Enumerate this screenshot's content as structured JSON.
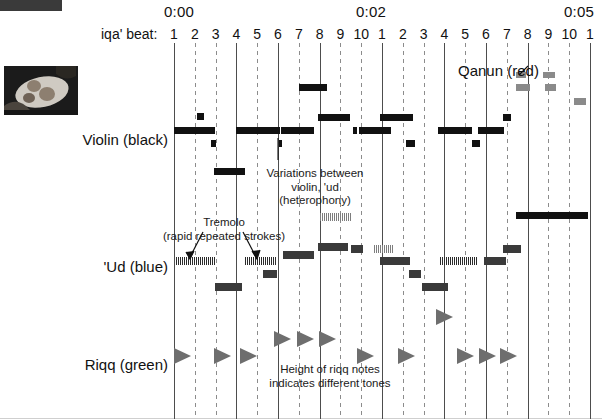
{
  "figure": {
    "title_slug": "",
    "thumbnail_alt": "riqq-photo"
  },
  "time_axis": {
    "ticks": [
      {
        "label": "0:00",
        "x": 182
      },
      {
        "label": "0:02",
        "x": 374
      },
      {
        "label": "0:05",
        "x": 582
      }
    ]
  },
  "beat_axis": {
    "title": "iqa' beat:",
    "labels": [
      "1",
      "2",
      "3",
      "4",
      "5",
      "6",
      "7",
      "8",
      "9",
      "10",
      "1",
      "2",
      "3",
      "4",
      "5",
      "6",
      "7",
      "8",
      "9",
      "10",
      "1"
    ]
  },
  "rows": [
    {
      "name": "violin",
      "label": "Violin (black)",
      "label_x": 78,
      "label_y": 131
    },
    {
      "name": "ud",
      "label": "'Ud (blue)",
      "label_x": 78,
      "label_y": 258
    },
    {
      "name": "riqq",
      "label": "Riqq (green)",
      "label_x": 78,
      "label_y": 356
    },
    {
      "name": "qanun",
      "label": "Qanun (red)",
      "label_x": 458,
      "label_y": 62
    }
  ],
  "annotations": [
    {
      "id": "heterophony",
      "text": "Variations between\nviolin, 'ud\n(heterophony)",
      "x": 315,
      "y": 167
    },
    {
      "id": "tremolo",
      "text": "Tremolo\n(rapid repeated strokes)",
      "x": 224,
      "y": 216
    },
    {
      "id": "riqq-height",
      "text": "Height of riqq notes\nindicates different tones",
      "x": 330,
      "y": 363
    }
  ],
  "chart_data": {
    "type": "timeline",
    "xlabel": "iqa' beat",
    "ylabel": "instrument",
    "grid": true,
    "x_start": 174,
    "x_end": 590,
    "beat_count": 21,
    "solid_beats": [
      1,
      4,
      6,
      8,
      11,
      14,
      16,
      18,
      21
    ],
    "legend": [
      {
        "name": "Violin",
        "color": "black"
      },
      {
        "name": "'Ud",
        "color": "blue"
      },
      {
        "name": "Riqq",
        "color": "green"
      },
      {
        "name": "Qanun",
        "color": "red"
      }
    ],
    "series": [
      {
        "name": "Violin (black)",
        "color": "#111111",
        "notes": [
          {
            "x": 174,
            "w": 41,
            "y": 127,
            "h": 7,
            "style": "solid"
          },
          {
            "x": 197,
            "w": 7,
            "y": 113,
            "h": 7,
            "style": "solid"
          },
          {
            "x": 198,
            "w": 7,
            "y": 127,
            "h": 7,
            "style": "solid"
          },
          {
            "x": 211,
            "w": 5,
            "y": 140,
            "h": 7,
            "style": "solid"
          },
          {
            "x": 214,
            "w": 31,
            "y": 168,
            "h": 7,
            "style": "solid"
          },
          {
            "x": 236,
            "w": 44,
            "y": 127,
            "h": 7,
            "style": "solid"
          },
          {
            "x": 279,
            "w": 3,
            "y": 140,
            "h": 7,
            "style": "solid"
          },
          {
            "x": 281,
            "w": 33,
            "y": 127,
            "h": 7,
            "style": "solid"
          },
          {
            "x": 318,
            "w": 32,
            "y": 114,
            "h": 7,
            "style": "solid"
          },
          {
            "x": 299,
            "w": 28,
            "y": 84,
            "h": 7,
            "style": "solid"
          },
          {
            "x": 353,
            "w": 4,
            "y": 127,
            "h": 7,
            "style": "solid"
          },
          {
            "x": 359,
            "w": 32,
            "y": 127,
            "h": 7,
            "style": "solid"
          },
          {
            "x": 380,
            "w": 33,
            "y": 114,
            "h": 7,
            "style": "solid"
          },
          {
            "x": 406,
            "w": 9,
            "y": 140,
            "h": 7,
            "style": "solid"
          },
          {
            "x": 438,
            "w": 30,
            "y": 127,
            "h": 7,
            "style": "solid"
          },
          {
            "x": 466,
            "w": 6,
            "y": 127,
            "h": 7,
            "style": "solid"
          },
          {
            "x": 472,
            "w": 8,
            "y": 140,
            "h": 7,
            "style": "solid"
          },
          {
            "x": 478,
            "w": 26,
            "y": 127,
            "h": 7,
            "style": "solid"
          },
          {
            "x": 503,
            "w": 8,
            "y": 114,
            "h": 7,
            "style": "solid"
          },
          {
            "x": 516,
            "w": 72,
            "y": 212,
            "h": 7,
            "style": "solid"
          }
        ]
      },
      {
        "name": "'Ud (blue)",
        "color": "#3a3a3a",
        "notes": [
          {
            "x": 176,
            "w": 40,
            "y": 257,
            "h": 8,
            "style": "tremolo"
          },
          {
            "x": 215,
            "w": 27,
            "y": 283,
            "h": 8,
            "style": "solid"
          },
          {
            "x": 245,
            "w": 31,
            "y": 257,
            "h": 8,
            "style": "tremolo"
          },
          {
            "x": 263,
            "w": 14,
            "y": 270,
            "h": 8,
            "style": "solid"
          },
          {
            "x": 283,
            "w": 31,
            "y": 251,
            "h": 8,
            "style": "solid"
          },
          {
            "x": 318,
            "w": 30,
            "y": 243,
            "h": 8,
            "style": "solid"
          },
          {
            "x": 320,
            "w": 32,
            "y": 213,
            "h": 8,
            "style": "tremolo-light"
          },
          {
            "x": 351,
            "w": 12,
            "y": 245,
            "h": 8,
            "style": "solid"
          },
          {
            "x": 374,
            "w": 20,
            "y": 245,
            "h": 8,
            "style": "tremolo-light"
          },
          {
            "x": 380,
            "w": 30,
            "y": 257,
            "h": 8,
            "style": "solid"
          },
          {
            "x": 409,
            "w": 12,
            "y": 270,
            "h": 8,
            "style": "solid"
          },
          {
            "x": 422,
            "w": 26,
            "y": 283,
            "h": 8,
            "style": "solid"
          },
          {
            "x": 440,
            "w": 38,
            "y": 257,
            "h": 8,
            "style": "tremolo"
          },
          {
            "x": 484,
            "w": 22,
            "y": 257,
            "h": 8,
            "style": "solid"
          },
          {
            "x": 503,
            "w": 18,
            "y": 245,
            "h": 8,
            "style": "solid"
          }
        ]
      },
      {
        "name": "Qanun (red)",
        "color": "#8a8a8a",
        "notes": [
          {
            "x": 516,
            "w": 10,
            "y": 72,
            "h": 6,
            "style": "solid"
          },
          {
            "x": 543,
            "w": 12,
            "y": 72,
            "h": 6,
            "style": "solid"
          },
          {
            "x": 516,
            "w": 14,
            "y": 84,
            "h": 7,
            "style": "solid"
          },
          {
            "x": 545,
            "w": 11,
            "y": 84,
            "h": 7,
            "style": "solid"
          },
          {
            "x": 574,
            "w": 12,
            "y": 98,
            "h": 7,
            "style": "solid"
          }
        ]
      },
      {
        "name": "Riqq (green)",
        "color": "#6e6e6e",
        "notes": [
          {
            "x": 174,
            "y": 348
          },
          {
            "x": 214,
            "y": 348
          },
          {
            "x": 240,
            "y": 348
          },
          {
            "x": 274,
            "y": 331
          },
          {
            "x": 297,
            "y": 331
          },
          {
            "x": 319,
            "y": 331
          },
          {
            "x": 357,
            "y": 348
          },
          {
            "x": 398,
            "y": 348
          },
          {
            "x": 436,
            "y": 309
          },
          {
            "x": 457,
            "y": 348
          },
          {
            "x": 479,
            "y": 348
          },
          {
            "x": 500,
            "y": 348
          }
        ]
      }
    ]
  }
}
